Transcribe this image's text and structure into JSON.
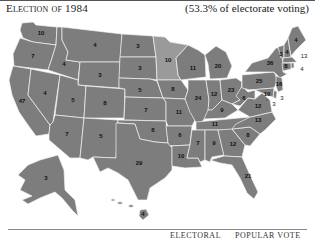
{
  "header": {
    "title": "Election of 1984",
    "subtitle": "(53.3% of electorate voting)"
  },
  "legend": {
    "electoral_label": "ELECTORAL",
    "popular_label": "POPULAR VOTE"
  },
  "colors": {
    "state_fill": "#7d7d7d",
    "minority_fill": "#9a9a9a",
    "border": "#f2f2f2"
  },
  "states": [
    {
      "abbr": "WA",
      "votes": "10"
    },
    {
      "abbr": "OR",
      "votes": "7"
    },
    {
      "abbr": "CA",
      "votes": "47"
    },
    {
      "abbr": "NV",
      "votes": "4"
    },
    {
      "abbr": "ID",
      "votes": "4"
    },
    {
      "abbr": "MT",
      "votes": "4"
    },
    {
      "abbr": "WY",
      "votes": "3"
    },
    {
      "abbr": "UT",
      "votes": "5"
    },
    {
      "abbr": "AZ",
      "votes": "7"
    },
    {
      "abbr": "CO",
      "votes": "8"
    },
    {
      "abbr": "NM",
      "votes": "5"
    },
    {
      "abbr": "ND",
      "votes": "3"
    },
    {
      "abbr": "SD",
      "votes": "3"
    },
    {
      "abbr": "NE",
      "votes": "5"
    },
    {
      "abbr": "KS",
      "votes": "7"
    },
    {
      "abbr": "OK",
      "votes": "8"
    },
    {
      "abbr": "TX",
      "votes": "29"
    },
    {
      "abbr": "MN",
      "votes": "10"
    },
    {
      "abbr": "IA",
      "votes": "8"
    },
    {
      "abbr": "MO",
      "votes": "11"
    },
    {
      "abbr": "AR",
      "votes": "6"
    },
    {
      "abbr": "LA",
      "votes": "10"
    },
    {
      "abbr": "WI",
      "votes": "11"
    },
    {
      "abbr": "IL",
      "votes": "24"
    },
    {
      "abbr": "MI",
      "votes": "20"
    },
    {
      "abbr": "IN",
      "votes": "12"
    },
    {
      "abbr": "OH",
      "votes": "23"
    },
    {
      "abbr": "KY",
      "votes": "9"
    },
    {
      "abbr": "TN",
      "votes": "11"
    },
    {
      "abbr": "MS",
      "votes": "7"
    },
    {
      "abbr": "AL",
      "votes": "9"
    },
    {
      "abbr": "GA",
      "votes": "12"
    },
    {
      "abbr": "FL",
      "votes": "21"
    },
    {
      "abbr": "SC",
      "votes": "8"
    },
    {
      "abbr": "NC",
      "votes": "13"
    },
    {
      "abbr": "VA",
      "votes": "12"
    },
    {
      "abbr": "WV",
      "votes": "6"
    },
    {
      "abbr": "PA",
      "votes": "25"
    },
    {
      "abbr": "NY",
      "votes": "36"
    },
    {
      "abbr": "VT",
      "votes": "3"
    },
    {
      "abbr": "NH",
      "votes": "4"
    },
    {
      "abbr": "ME",
      "votes": "4"
    },
    {
      "abbr": "MA",
      "votes": "13"
    },
    {
      "abbr": "RI",
      "votes": "4"
    },
    {
      "abbr": "CT",
      "votes": "8"
    },
    {
      "abbr": "NJ",
      "votes": "16"
    },
    {
      "abbr": "DE",
      "votes": "3"
    },
    {
      "abbr": "MD",
      "votes": "10"
    },
    {
      "abbr": "DC",
      "votes": "3"
    },
    {
      "abbr": "AK",
      "votes": "3"
    },
    {
      "abbr": "HI",
      "votes": "4"
    }
  ]
}
